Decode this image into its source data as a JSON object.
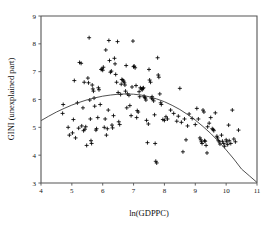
{
  "chart_data": {
    "type": "scatter",
    "title": "",
    "xlabel": "ln(GDPPC)",
    "ylabel": "GINI (unexplained part)",
    "xlim": [
      4,
      11
    ],
    "ylim": [
      3,
      9
    ],
    "xticks": [
      4,
      5,
      6,
      7,
      8,
      9,
      10,
      11
    ],
    "yticks": [
      3,
      4,
      5,
      6,
      7,
      8,
      9
    ],
    "grid": false,
    "legend": null,
    "marker_style": "plus",
    "marker_color": "#000000",
    "frame_color": "#555555",
    "background_color": "#ffffff",
    "series": [
      {
        "name": "observations",
        "marker": "plus",
        "points": [
          [
            4.72,
            5.82
          ],
          [
            4.7,
            5.5
          ],
          [
            4.88,
            5.0
          ],
          [
            4.92,
            4.72
          ],
          [
            5.02,
            4.8
          ],
          [
            5.05,
            5.28
          ],
          [
            5.08,
            6.68
          ],
          [
            5.12,
            4.62
          ],
          [
            5.18,
            5.88
          ],
          [
            5.22,
            4.97
          ],
          [
            5.25,
            7.33
          ],
          [
            5.3,
            7.3
          ],
          [
            5.32,
            5.05
          ],
          [
            5.36,
            5.7
          ],
          [
            5.38,
            4.88
          ],
          [
            5.4,
            6.62
          ],
          [
            5.42,
            4.93
          ],
          [
            5.45,
            5.02
          ],
          [
            5.48,
            4.35
          ],
          [
            5.52,
            6.77
          ],
          [
            5.54,
            6.6
          ],
          [
            5.56,
            8.22
          ],
          [
            5.58,
            5.98
          ],
          [
            5.6,
            5.3
          ],
          [
            5.62,
            4.52
          ],
          [
            5.64,
            4.42
          ],
          [
            5.66,
            6.52
          ],
          [
            5.68,
            6.38
          ],
          [
            5.7,
            6.3
          ],
          [
            5.72,
            6.05
          ],
          [
            5.74,
            5.76
          ],
          [
            5.78,
            4.9
          ],
          [
            5.8,
            4.95
          ],
          [
            5.84,
            5.35
          ],
          [
            5.86,
            6.42
          ],
          [
            5.88,
            6.35
          ],
          [
            5.92,
            5.82
          ],
          [
            5.95,
            7.08
          ],
          [
            5.98,
            7.1
          ],
          [
            6.0,
            7.05
          ],
          [
            6.02,
            7.16
          ],
          [
            6.05,
            5.0
          ],
          [
            6.08,
            5.3
          ],
          [
            6.1,
            7.78
          ],
          [
            6.12,
            4.72
          ],
          [
            6.15,
            4.95
          ],
          [
            6.18,
            5.62
          ],
          [
            6.2,
            8.12
          ],
          [
            6.22,
            7.4
          ],
          [
            6.25,
            6.98
          ],
          [
            6.28,
            7.02
          ],
          [
            6.3,
            5.08
          ],
          [
            6.32,
            4.98
          ],
          [
            6.35,
            5.42
          ],
          [
            6.38,
            7.48
          ],
          [
            6.4,
            7.28
          ],
          [
            6.42,
            6.9
          ],
          [
            6.45,
            6.62
          ],
          [
            6.48,
            8.08
          ],
          [
            6.5,
            6.25
          ],
          [
            6.52,
            5.2
          ],
          [
            6.55,
            5.1
          ],
          [
            6.58,
            6.18
          ],
          [
            6.6,
            6.55
          ],
          [
            6.62,
            6.72
          ],
          [
            6.65,
            6.7
          ],
          [
            6.68,
            6.66
          ],
          [
            6.7,
            6.6
          ],
          [
            6.72,
            6.52
          ],
          [
            6.74,
            6.3
          ],
          [
            6.76,
            7.22
          ],
          [
            6.78,
            5.7
          ],
          [
            6.8,
            6.2
          ],
          [
            6.85,
            6.15
          ],
          [
            6.88,
            5.78
          ],
          [
            6.92,
            5.42
          ],
          [
            6.95,
            6.45
          ],
          [
            6.98,
            8.1
          ],
          [
            7.0,
            7.18
          ],
          [
            7.02,
            7.2
          ],
          [
            7.05,
            7.14
          ],
          [
            7.08,
            6.5
          ],
          [
            7.1,
            5.35
          ],
          [
            7.12,
            5.6
          ],
          [
            7.15,
            5.55
          ],
          [
            7.18,
            6.28
          ],
          [
            7.2,
            6.1
          ],
          [
            7.22,
            6.42
          ],
          [
            7.25,
            6.38
          ],
          [
            7.28,
            6.35
          ],
          [
            7.3,
            6.4
          ],
          [
            7.32,
            6.42
          ],
          [
            7.34,
            6.12
          ],
          [
            7.36,
            6.08
          ],
          [
            7.38,
            6.05
          ],
          [
            7.4,
            5.98
          ],
          [
            7.42,
            5.25
          ],
          [
            7.45,
            4.45
          ],
          [
            7.48,
            5.12
          ],
          [
            7.5,
            7.08
          ],
          [
            7.52,
            6.7
          ],
          [
            7.55,
            6.62
          ],
          [
            7.58,
            6.05
          ],
          [
            7.6,
            6.1
          ],
          [
            7.62,
            6.02
          ],
          [
            7.65,
            5.95
          ],
          [
            7.68,
            5.45
          ],
          [
            7.7,
            4.42
          ],
          [
            7.72,
            3.78
          ],
          [
            7.75,
            3.72
          ],
          [
            7.78,
            7.5
          ],
          [
            7.8,
            6.88
          ],
          [
            7.82,
            6.8
          ],
          [
            7.85,
            6.2
          ],
          [
            7.88,
            5.88
          ],
          [
            7.9,
            5.82
          ],
          [
            7.95,
            5.28
          ],
          [
            8.0,
            5.25
          ],
          [
            8.05,
            5.38
          ],
          [
            8.1,
            5.3
          ],
          [
            8.2,
            5.62
          ],
          [
            8.3,
            5.5
          ],
          [
            8.4,
            5.22
          ],
          [
            8.45,
            5.4
          ],
          [
            8.5,
            6.4
          ],
          [
            8.55,
            5.18
          ],
          [
            8.6,
            4.12
          ],
          [
            8.65,
            5.3
          ],
          [
            8.7,
            4.55
          ],
          [
            8.75,
            5.05
          ],
          [
            8.8,
            5.48
          ],
          [
            8.9,
            5.32
          ],
          [
            9.0,
            5.1
          ],
          [
            9.05,
            5.68
          ],
          [
            9.1,
            5.3
          ],
          [
            9.15,
            4.62
          ],
          [
            9.18,
            4.55
          ],
          [
            9.2,
            4.48
          ],
          [
            9.22,
            4.42
          ],
          [
            9.25,
            5.62
          ],
          [
            9.28,
            5.55
          ],
          [
            9.3,
            4.52
          ],
          [
            9.32,
            4.5
          ],
          [
            9.35,
            4.35
          ],
          [
            9.38,
            4.08
          ],
          [
            9.4,
            5.02
          ],
          [
            9.45,
            5.15
          ],
          [
            9.5,
            5.35
          ],
          [
            9.55,
            4.95
          ],
          [
            9.58,
            4.92
          ],
          [
            9.6,
            4.88
          ],
          [
            9.65,
            5.52
          ],
          [
            9.7,
            4.68
          ],
          [
            9.72,
            4.62
          ],
          [
            9.75,
            4.52
          ],
          [
            9.78,
            4.48
          ],
          [
            9.8,
            4.4
          ],
          [
            9.85,
            4.72
          ],
          [
            9.88,
            4.5
          ],
          [
            9.92,
            4.42
          ],
          [
            9.95,
            4.32
          ],
          [
            10.0,
            4.55
          ],
          [
            10.02,
            4.48
          ],
          [
            10.05,
            4.38
          ],
          [
            10.08,
            5.08
          ],
          [
            10.1,
            4.52
          ],
          [
            10.15,
            4.42
          ],
          [
            10.2,
            5.62
          ],
          [
            10.25,
            4.58
          ],
          [
            10.3,
            4.48
          ],
          [
            10.4,
            4.9
          ]
        ]
      }
    ],
    "fit_curve": {
      "name": "quadratic fit",
      "color": "#3c3c3c",
      "points": [
        [
          4.0,
          5.24
        ],
        [
          4.25,
          5.4
        ],
        [
          4.5,
          5.55
        ],
        [
          4.75,
          5.68
        ],
        [
          5.0,
          5.8
        ],
        [
          5.25,
          5.9
        ],
        [
          5.5,
          5.99
        ],
        [
          5.75,
          6.06
        ],
        [
          6.0,
          6.12
        ],
        [
          6.25,
          6.16
        ],
        [
          6.5,
          6.19
        ],
        [
          6.75,
          6.2
        ],
        [
          7.0,
          6.19
        ],
        [
          7.25,
          6.16
        ],
        [
          7.5,
          6.1
        ],
        [
          7.75,
          6.02
        ],
        [
          8.0,
          5.92
        ],
        [
          8.25,
          5.79
        ],
        [
          8.5,
          5.64
        ],
        [
          8.75,
          5.46
        ],
        [
          9.0,
          5.26
        ],
        [
          9.25,
          5.03
        ],
        [
          9.5,
          4.78
        ],
        [
          9.75,
          4.5
        ],
        [
          10.0,
          4.19
        ],
        [
          10.25,
          3.86
        ],
        [
          10.5,
          3.5
        ],
        [
          10.75,
          3.26
        ],
        [
          11.0,
          3.02
        ]
      ]
    }
  },
  "axes": {
    "x_title": "ln(GDPPC)",
    "y_title": "GINI (unexplained part)",
    "x_tick_labels": [
      "4",
      "5",
      "6",
      "7",
      "8",
      "9",
      "10",
      "11"
    ],
    "y_tick_labels": [
      "3",
      "4",
      "5",
      "6",
      "7",
      "8",
      "9"
    ]
  }
}
